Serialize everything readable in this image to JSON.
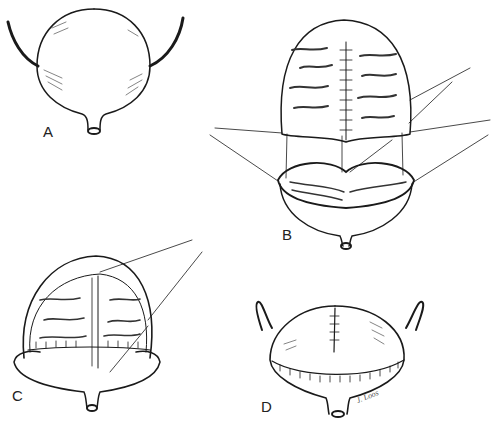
{
  "figure": {
    "type": "surgical illustration",
    "panels": [
      {
        "id": "A",
        "label": "A",
        "description": "Intact bladder with ureters and urethral outlet"
      },
      {
        "id": "B",
        "label": "B",
        "description": "Detubularized bowel patch with midline suture, positioned above opened bladder with stay sutures"
      },
      {
        "id": "C",
        "label": "C",
        "description": "Bowel patch being sutured onto opened bladder rim"
      },
      {
        "id": "D",
        "label": "D",
        "description": "Completed augmented bladder with circumferential suture line"
      }
    ],
    "signature": "J. Loos"
  }
}
